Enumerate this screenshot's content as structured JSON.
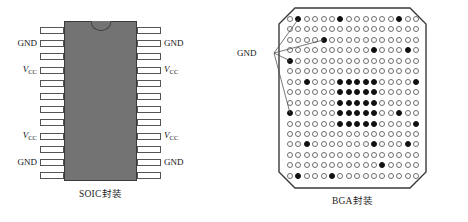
{
  "figure": {
    "background_color": "#ffffff",
    "ink_color": "#1a1a1a"
  },
  "soic": {
    "caption": "SOIC封装",
    "body_color": "#737373",
    "pin_count_per_side": 12,
    "total_pins": 24,
    "notch": "semicircular-orientation-notch-top-center",
    "left_labels": [
      {
        "index": 1,
        "text": "GND",
        "italic": false,
        "sub": ""
      },
      {
        "index": 3,
        "text": "V",
        "italic": true,
        "sub": "CC"
      },
      {
        "index": 8,
        "text": "V",
        "italic": true,
        "sub": "CC"
      },
      {
        "index": 10,
        "text": "GND",
        "italic": false,
        "sub": ""
      }
    ],
    "right_labels": [
      {
        "index": 1,
        "text": "GND",
        "italic": false,
        "sub": ""
      },
      {
        "index": 3,
        "text": "V",
        "italic": true,
        "sub": "CC"
      },
      {
        "index": 8,
        "text": "V",
        "italic": true,
        "sub": "CC"
      },
      {
        "index": 10,
        "text": "GND",
        "italic": false,
        "sub": ""
      }
    ]
  },
  "bga": {
    "caption": "BGA封装",
    "gnd_label": "GND",
    "grid_rows": 16,
    "grid_cols": 16,
    "ball_fill_color": "#111111",
    "ball_outline_color": "#6e6e6e",
    "corner_style": "chamfered",
    "filled_balls": [
      [
        0,
        1
      ],
      [
        0,
        6
      ],
      [
        0,
        13
      ],
      [
        2,
        4
      ],
      [
        3,
        10
      ],
      [
        3,
        14
      ],
      [
        4,
        0
      ],
      [
        6,
        2
      ],
      [
        6,
        6
      ],
      [
        6,
        7
      ],
      [
        6,
        8
      ],
      [
        6,
        9
      ],
      [
        6,
        10
      ],
      [
        6,
        15
      ],
      [
        7,
        6
      ],
      [
        7,
        7
      ],
      [
        7,
        8
      ],
      [
        7,
        9
      ],
      [
        7,
        10
      ],
      [
        8,
        6
      ],
      [
        8,
        7
      ],
      [
        8,
        8
      ],
      [
        8,
        9
      ],
      [
        8,
        10
      ],
      [
        9,
        0
      ],
      [
        9,
        6
      ],
      [
        9,
        7
      ],
      [
        9,
        8
      ],
      [
        9,
        9
      ],
      [
        9,
        10
      ],
      [
        9,
        13
      ],
      [
        10,
        6
      ],
      [
        10,
        7
      ],
      [
        10,
        8
      ],
      [
        10,
        9
      ],
      [
        10,
        10
      ],
      [
        10,
        15
      ],
      [
        12,
        2
      ],
      [
        12,
        10
      ],
      [
        12,
        14
      ],
      [
        14,
        11
      ],
      [
        15,
        1
      ],
      [
        15,
        5
      ]
    ],
    "leader_targets": [
      [
        0,
        1
      ],
      [
        2,
        4
      ],
      [
        4,
        0
      ],
      [
        9,
        0
      ]
    ]
  }
}
